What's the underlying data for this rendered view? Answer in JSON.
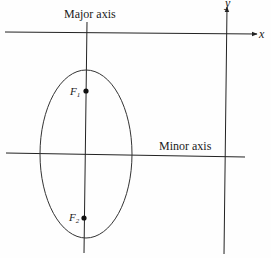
{
  "diagram": {
    "type": "ellipse-with-axes",
    "labels": {
      "major_axis": "Major axis",
      "minor_axis": "Minor axis",
      "x_axis": "x",
      "y_axis": "y",
      "focus1": "F",
      "focus1_sub": "1",
      "focus2": "F",
      "focus2_sub": "2"
    },
    "colors": {
      "stroke": "#222222",
      "background": "#fefefe"
    }
  }
}
